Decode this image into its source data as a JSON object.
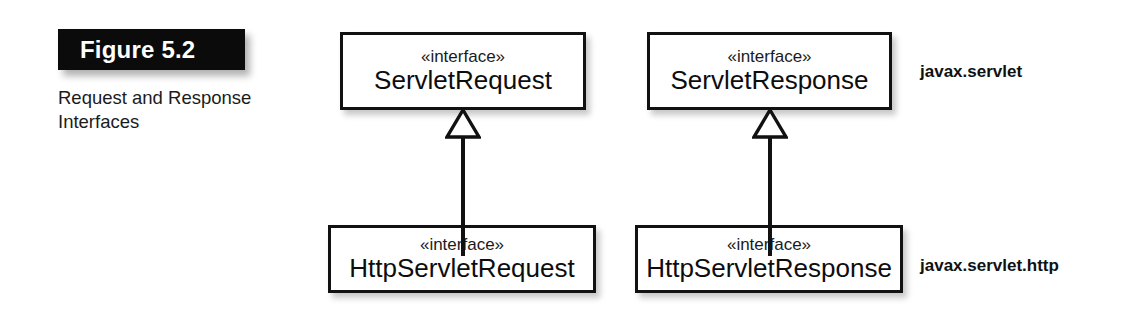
{
  "figure": {
    "label": "Figure 5.2",
    "caption": "Request and Response Interfaces"
  },
  "diagram": {
    "type": "uml-class-diagram",
    "relationship": "generalization",
    "boxes": [
      {
        "id": "servlet-request",
        "stereotype": "«interface»",
        "name": "ServletRequest",
        "package": "javax.servlet"
      },
      {
        "id": "servlet-response",
        "stereotype": "«interface»",
        "name": "ServletResponse",
        "package": "javax.servlet"
      },
      {
        "id": "http-servlet-request",
        "stereotype": "«interface»",
        "name": "HttpServletRequest",
        "package": "javax.servlet.http"
      },
      {
        "id": "http-servlet-response",
        "stereotype": "«interface»",
        "name": "HttpServletResponse",
        "package": "javax.servlet.http"
      }
    ],
    "packages": [
      {
        "id": "javax-servlet",
        "label": "javax.servlet"
      },
      {
        "id": "javax-servlet-http",
        "label": "javax.servlet.http"
      }
    ],
    "edges": [
      {
        "from": "http-servlet-request",
        "to": "servlet-request",
        "kind": "generalization"
      },
      {
        "from": "http-servlet-response",
        "to": "servlet-response",
        "kind": "generalization"
      }
    ]
  },
  "colors": {
    "label_background": "#0b0b0b",
    "label_text": "#ffffff",
    "box_border": "#111111",
    "box_fill": "#ffffff",
    "page_background": "#ffffff",
    "body_text": "#111111"
  }
}
